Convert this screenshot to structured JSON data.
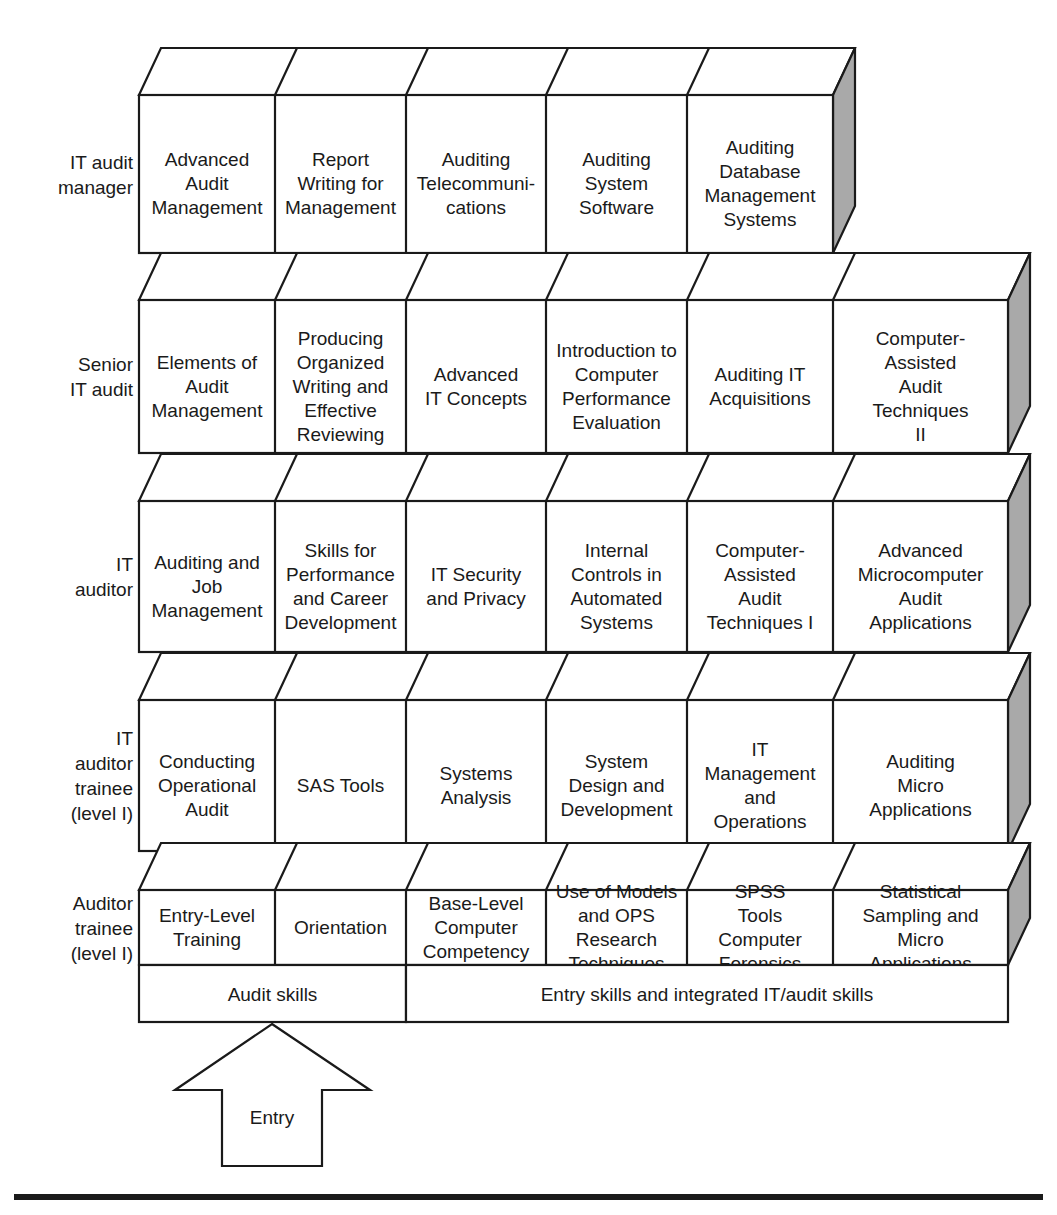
{
  "diagram": {
    "colors": {
      "line": "#1a1a1a",
      "face": "#ffffff",
      "side_shade": "#a9a9a9",
      "background": "#ffffff"
    },
    "rows": [
      {
        "label_lines": [
          "IT audit",
          "manager"
        ],
        "boxes": [
          {
            "lines": [
              "Advanced",
              "Audit",
              "Management"
            ]
          },
          {
            "lines": [
              "Report",
              "Writing for",
              "Management"
            ]
          },
          {
            "lines": [
              "Auditing",
              "Telecommuni-",
              "cations"
            ]
          },
          {
            "lines": [
              "Auditing",
              "System",
              "Software"
            ]
          },
          {
            "lines": [
              "Auditing",
              "Database",
              "Management",
              "Systems"
            ]
          }
        ]
      },
      {
        "label_lines": [
          "Senior",
          "IT audit"
        ],
        "boxes": [
          {
            "lines": [
              "Elements of",
              "Audit",
              "Management"
            ]
          },
          {
            "lines": [
              "Producing",
              "Organized",
              "Writing and",
              "Effective",
              "Reviewing"
            ]
          },
          {
            "lines": [
              "Advanced",
              "IT Concepts"
            ]
          },
          {
            "lines": [
              "Introduction to",
              "Computer",
              "Performance",
              "Evaluation"
            ]
          },
          {
            "lines": [
              "Auditing IT",
              "Acquisitions"
            ]
          },
          {
            "lines": [
              "Computer-",
              "Assisted",
              "Audit",
              "Techniques",
              "II"
            ]
          }
        ]
      },
      {
        "label_lines": [
          "IT",
          "auditor"
        ],
        "boxes": [
          {
            "lines": [
              "Auditing and",
              "Job",
              "Management"
            ]
          },
          {
            "lines": [
              "Skills for",
              "Performance",
              "and Career",
              "Development"
            ]
          },
          {
            "lines": [
              "IT Security",
              "and Privacy"
            ]
          },
          {
            "lines": [
              "Internal",
              "Controls in",
              "Automated",
              "Systems"
            ]
          },
          {
            "lines": [
              "Computer-",
              "Assisted",
              "Audit",
              "Techniques I"
            ]
          },
          {
            "lines": [
              "Advanced",
              "Microcomputer",
              "Audit",
              "Applications"
            ]
          }
        ]
      },
      {
        "label_lines": [
          "IT",
          "auditor",
          "trainee",
          "(level I)"
        ],
        "boxes": [
          {
            "lines": [
              "Conducting",
              "Operational",
              "Audit"
            ]
          },
          {
            "lines": [
              "SAS Tools"
            ]
          },
          {
            "lines": [
              "Systems",
              "Analysis"
            ]
          },
          {
            "lines": [
              "System",
              "Design and",
              "Development"
            ]
          },
          {
            "lines": [
              "IT",
              "Management",
              "and",
              "Operations"
            ]
          },
          {
            "lines": [
              "Auditing",
              "Micro",
              "Applications"
            ]
          }
        ]
      },
      {
        "label_lines": [
          "Auditor",
          "trainee",
          "(level I)"
        ],
        "boxes": [
          {
            "lines": [
              "Entry-Level",
              "Training"
            ]
          },
          {
            "lines": [
              "Orientation"
            ]
          },
          {
            "lines": [
              "Base-Level",
              "Computer",
              "Competency"
            ]
          },
          {
            "lines": [
              "Use of Models",
              "and OPS",
              "Research",
              "Techniques"
            ]
          },
          {
            "lines": [
              "SPSS",
              "Tools",
              "Computer",
              "Forensics"
            ]
          },
          {
            "lines": [
              "Statistical",
              "Sampling and",
              "Micro",
              "Applications"
            ]
          }
        ]
      }
    ],
    "skills_band": [
      {
        "label": "Audit skills"
      },
      {
        "label": "Entry skills and integrated IT/audit skills"
      }
    ],
    "entry_arrow": {
      "label": "Entry"
    }
  }
}
